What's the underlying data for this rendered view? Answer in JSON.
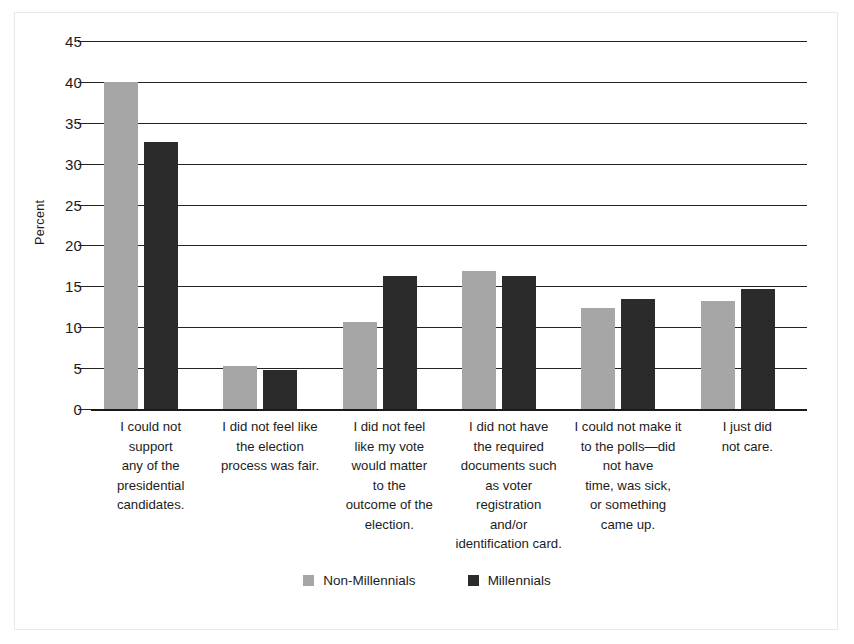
{
  "chart_data": {
    "type": "bar",
    "title": "",
    "xlabel": "",
    "ylabel": "Percent",
    "ylim": [
      0,
      45
    ],
    "ytick_step": 5,
    "yticks": [
      45,
      40,
      35,
      30,
      25,
      20,
      15,
      10,
      5,
      0
    ],
    "grid": true,
    "legend_position": "bottom-center",
    "categories": [
      "I could not support any of the presidential candidates.",
      "I did not feel like the election process was fair.",
      "I did not feel like my vote would matter to the outcome of the election.",
      "I did not have the required documents such as voter registration and/or identification card.",
      "I could not make it to the polls—did not have time, was sick, or something came up.",
      "I just did not care."
    ],
    "category_lines": [
      [
        "I could not",
        "support",
        "any of the",
        "presidential",
        "candidates."
      ],
      [
        "I did not feel like",
        "the election",
        "process was fair."
      ],
      [
        "I did not feel",
        "like my vote",
        "would matter",
        "to the",
        "outcome of the",
        "election."
      ],
      [
        "I did not have",
        "the required",
        "documents such",
        "as voter",
        "registration",
        "and/or",
        "identification card."
      ],
      [
        "I could not make it",
        "to the polls—did",
        "not have",
        "time, was sick,",
        "or something",
        "came up."
      ],
      [
        "I just did",
        "not care."
      ]
    ],
    "series": [
      {
        "name": "Non-Millennials",
        "color": "#a6a6a6",
        "values": [
          40.0,
          5.3,
          10.7,
          16.9,
          12.4,
          13.2
        ]
      },
      {
        "name": "Millennials",
        "color": "#2b2b2b",
        "values": [
          32.7,
          4.8,
          16.3,
          16.3,
          13.4,
          14.7
        ]
      }
    ]
  },
  "legend": {
    "items": [
      {
        "label": "Non-Millennials",
        "color": "#a6a6a6"
      },
      {
        "label": "Millennials",
        "color": "#2b2b2b"
      }
    ]
  },
  "axis": {
    "y_title": "Percent"
  }
}
